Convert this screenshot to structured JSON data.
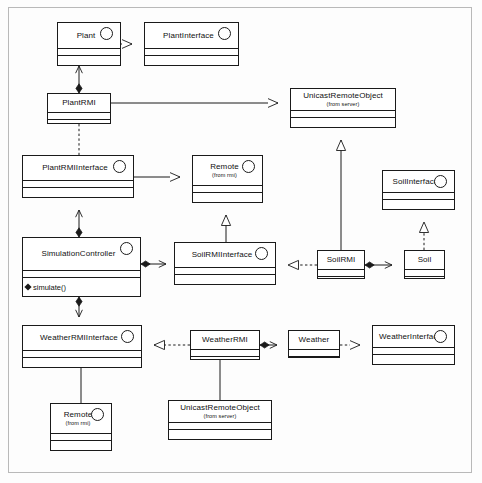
{
  "diagram": {
    "type": "uml-class-diagram",
    "background": "#fdfdfd",
    "line_color": "#1a1a1a"
  },
  "classes": [
    {
      "id": "plant",
      "name": "Plant",
      "stereotype": "",
      "interface": true,
      "x": 57,
      "y": 22,
      "w": 64,
      "h": 44
    },
    {
      "id": "plantinterface",
      "name": "PlantInterface",
      "stereotype": "",
      "interface": true,
      "x": 144,
      "y": 22,
      "w": 95,
      "h": 44
    },
    {
      "id": "plantrmi",
      "name": "PlantRMI",
      "stereotype": "",
      "interface": false,
      "x": 47,
      "y": 93,
      "w": 64,
      "h": 31
    },
    {
      "id": "unicast_top",
      "name": "UnicastRemoteObject",
      "stereotype": "(from server)",
      "interface": false,
      "x": 290,
      "y": 88,
      "w": 106,
      "h": 40
    },
    {
      "id": "plantrmiiface",
      "name": "PlantRMIInterface",
      "stereotype": "",
      "interface": true,
      "x": 22,
      "y": 155,
      "w": 112,
      "h": 43
    },
    {
      "id": "remote_mid",
      "name": "Remote",
      "stereotype": "(from rmi)",
      "interface": true,
      "x": 192,
      "y": 155,
      "w": 71,
      "h": 48
    },
    {
      "id": "soilinterface",
      "name": "SoilInterface",
      "stereotype": "",
      "interface": true,
      "x": 382,
      "y": 170,
      "w": 73,
      "h": 40
    },
    {
      "id": "simctrl",
      "name": "SimulationController",
      "stereotype": "",
      "interface": true,
      "x": 22,
      "y": 237,
      "w": 119,
      "h": 60
    },
    {
      "id": "soilrmiiface",
      "name": "SoilRMIInterface",
      "stereotype": "",
      "interface": true,
      "x": 174,
      "y": 242,
      "w": 102,
      "h": 43
    },
    {
      "id": "soilrmi",
      "name": "SoilRMI",
      "stereotype": "",
      "interface": false,
      "x": 317,
      "y": 250,
      "w": 48,
      "h": 29
    },
    {
      "id": "soil",
      "name": "Soil",
      "stereotype": "",
      "interface": false,
      "x": 404,
      "y": 250,
      "w": 41,
      "h": 29
    },
    {
      "id": "weatherrmiiface",
      "name": "WeatherRMIInterface",
      "stereotype": "",
      "interface": true,
      "x": 22,
      "y": 325,
      "w": 120,
      "h": 43
    },
    {
      "id": "weatherrmi",
      "name": "WeatherRMI",
      "stereotype": "",
      "interface": false,
      "x": 190,
      "y": 330,
      "w": 70,
      "h": 30
    },
    {
      "id": "weather",
      "name": "Weather",
      "stereotype": "",
      "interface": false,
      "x": 288,
      "y": 330,
      "w": 52,
      "h": 28
    },
    {
      "id": "weatherinterface",
      "name": "WeatherInterface",
      "stereotype": "",
      "interface": true,
      "x": 372,
      "y": 325,
      "w": 83,
      "h": 40
    },
    {
      "id": "remote_bot",
      "name": "Remote",
      "stereotype": "(from rmi)",
      "interface": true,
      "x": 50,
      "y": 403,
      "w": 62,
      "h": 48
    },
    {
      "id": "unicast_bot",
      "name": "UnicastRemoteObject",
      "stereotype": "(from server)",
      "interface": false,
      "x": 168,
      "y": 400,
      "w": 104,
      "h": 40
    }
  ],
  "operations": {
    "simctrl": [
      "simulate()"
    ]
  },
  "relations": [
    {
      "id": "r1",
      "from": "plant",
      "to": "plantinterface",
      "kind": "realization"
    },
    {
      "id": "r2",
      "from": "plantrmi",
      "to": "plant",
      "kind": "composition"
    },
    {
      "id": "r3",
      "from": "plantrmi",
      "to": "unicast_top",
      "kind": "generalization"
    },
    {
      "id": "r4",
      "from": "plantrmi",
      "to": "plantrmiiface",
      "kind": "realization"
    },
    {
      "id": "r5",
      "from": "plantrmiiface",
      "to": "remote_mid",
      "kind": "generalization"
    },
    {
      "id": "r6",
      "from": "simctrl",
      "to": "plantrmiiface",
      "kind": "composition"
    },
    {
      "id": "r7",
      "from": "simctrl",
      "to": "soilrmiiface",
      "kind": "composition"
    },
    {
      "id": "r8",
      "from": "simctrl",
      "to": "weatherrmiiface",
      "kind": "composition"
    },
    {
      "id": "r9",
      "from": "soilrmiiface",
      "to": "remote_mid",
      "kind": "generalization"
    },
    {
      "id": "r10",
      "from": "soilrmi",
      "to": "soilrmiiface",
      "kind": "realization"
    },
    {
      "id": "r11",
      "from": "soilrmi",
      "to": "unicast_top",
      "kind": "generalization"
    },
    {
      "id": "r12",
      "from": "soilrmi",
      "to": "soil",
      "kind": "composition"
    },
    {
      "id": "r13",
      "from": "soil",
      "to": "soilinterface",
      "kind": "realization"
    },
    {
      "id": "r14",
      "from": "weatherrmi",
      "to": "weatherrmiiface",
      "kind": "realization"
    },
    {
      "id": "r15",
      "from": "weatherrmi",
      "to": "weather",
      "kind": "composition"
    },
    {
      "id": "r16",
      "from": "weather",
      "to": "weatherinterface",
      "kind": "realization"
    },
    {
      "id": "r17",
      "from": "weatherrmiiface",
      "to": "remote_bot",
      "kind": "generalization"
    },
    {
      "id": "r18",
      "from": "weatherrmi",
      "to": "unicast_bot",
      "kind": "generalization"
    }
  ]
}
